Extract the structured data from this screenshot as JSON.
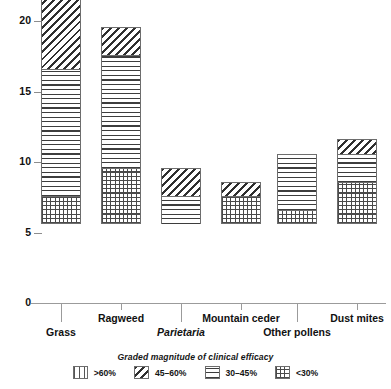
{
  "chart_data": {
    "type": "bar",
    "subtype": "stacked-bar",
    "title": "",
    "xlabel": "",
    "ylabel": "",
    "ylim": [
      0,
      21.5
    ],
    "yticks": [
      0,
      5,
      10,
      15,
      20
    ],
    "ytick_labels": [
      "0",
      "5",
      "10",
      "15",
      "20"
    ],
    "grid": false,
    "legend_position": "bottom",
    "legend_title": "Graded magnitude of clinical efficacy",
    "categories": [
      "Grass",
      "Ragweed",
      "Parietaria",
      "Mountain ceder",
      "Other pollens",
      "Dust mites"
    ],
    "category_styles": [
      "normal",
      "normal",
      "italic",
      "normal",
      "normal",
      "normal"
    ],
    "series": [
      {
        "name": "<30%",
        "pattern": "cross-hatch",
        "values": [
          2,
          4,
          0,
          2,
          1,
          3
        ]
      },
      {
        "name": "30-45%",
        "pattern": "horizontal-lines",
        "values": [
          9,
          8,
          2,
          0,
          4,
          2
        ]
      },
      {
        "name": "45-60%",
        "pattern": "diagonal-hatch",
        "values": [
          7,
          2,
          2,
          1,
          0,
          1
        ]
      },
      {
        "name": ">60%",
        "pattern": "vertical-lines",
        "values": [
          3,
          0,
          0,
          0,
          0,
          0
        ]
      }
    ],
    "totals": [
      21,
      14,
      4,
      3,
      5,
      6
    ]
  },
  "legend": {
    "title": "Graded magnitude of clinical efficacy",
    "items": [
      {
        "label": ">60%",
        "pattern": "vertical-lines"
      },
      {
        "label": "45–60%",
        "pattern": "diagonal-hatch"
      },
      {
        "label": "30–45%",
        "pattern": "horizontal-lines"
      },
      {
        "label": "<30%",
        "pattern": "cross-hatch"
      }
    ]
  },
  "axis": {
    "y_ticks": [
      {
        "label": "20",
        "value": 20
      },
      {
        "label": "15",
        "value": 15
      },
      {
        "label": "10",
        "value": 10
      },
      {
        "label": "5",
        "value": 5
      },
      {
        "label": "0",
        "value": 0
      }
    ]
  },
  "colors": {
    "ink": "#1a1a1a",
    "axis": "#9b9b9b",
    "bar_outline": "#6d6d6d",
    "background": "#ffffff"
  }
}
